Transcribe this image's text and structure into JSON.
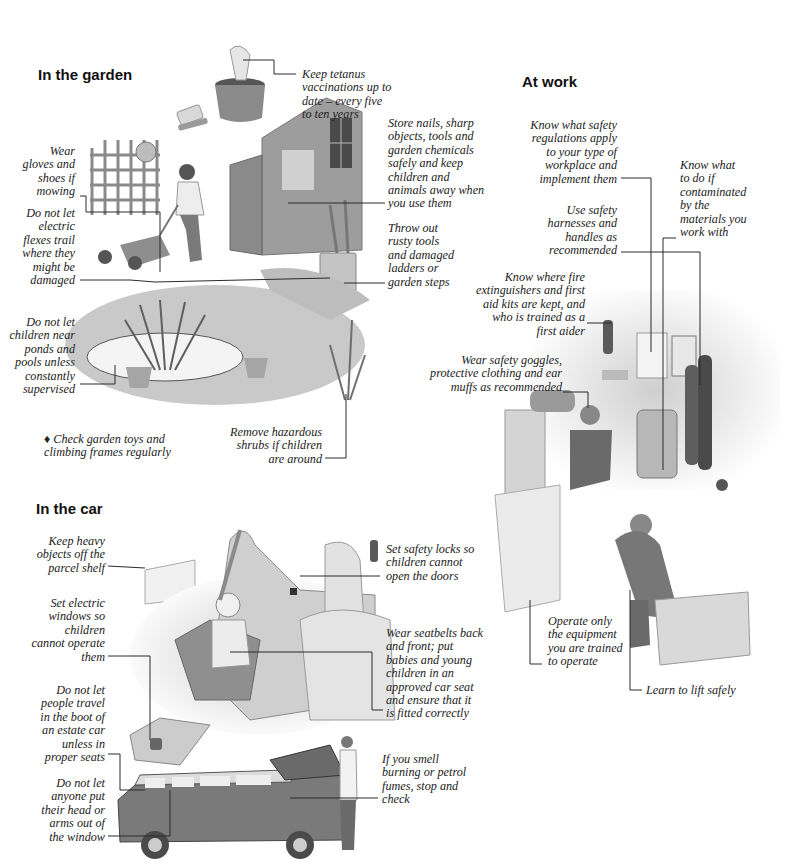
{
  "sections": {
    "garden": {
      "heading": "In the garden",
      "captions": {
        "tetanus": "Keep tetanus\nvaccinations up to\ndate – every five\nto ten years",
        "store": "Store nails, sharp\nobjects, tools and\ngarden chemicals\nsafely and keep\nchildren and\nanimals away when\nyou use them",
        "throw": "Throw out\nrusty tools\nand damaged\nladders or\ngarden steps",
        "gloves": "Wear\ngloves and\nshoes if\nmowing",
        "flexes": "Do not let\nelectric\nflexes trail\nwhere they\nmight be\ndamaged",
        "ponds": "Do not let\nchildren near\nponds and\npools unless\nconstantly\nsupervised",
        "toys": "♦ Check garden toys and\nclimbing frames regularly",
        "shrubs": "Remove hazardous\nshrubs if children\nare around"
      }
    },
    "work": {
      "heading": "At work",
      "captions": {
        "regulations": "Know what safety\nregulations apply\nto your type of\nworkplace and\nimplement them",
        "contaminated": "Know what\nto do if\ncontaminated\nby the\nmaterials you\nwork with",
        "harnesses": "Use safety\nharnesses and\nhandles as\nrecommended",
        "fire": "Know where fire\nextinguishers and first\naid kits are kept, and\nwho is trained as a\nfirst aider",
        "goggles": "Wear safety goggles,\nprotective clothing and ear\nmuffs as recommended",
        "operate": "Operate only\nthe equipment\nyou are trained\nto operate",
        "lift": "Learn to lift safely"
      }
    },
    "car": {
      "heading": "In the car",
      "captions": {
        "parcel": "Keep heavy\nobjects off the\nparcel shelf",
        "windows": "Set electric\nwindows so\nchildren\ncannot operate\nthem",
        "boot": "Do not let\npeople travel\nin the boot of\nan estate car\nunless in\nproper seats",
        "head": "Do not let\nanyone put\ntheir head or\narms out of\nthe window",
        "locks": "Set safety locks so\nchildren cannot\nopen the doors",
        "seatbelts": "Wear seatbelts back\nand front; put\nbabies and young\nchildren in an\napproved car seat\nand ensure that it\nis fitted correctly",
        "fumes": "If you smell\nburning or petrol\nfumes, stop and\ncheck"
      }
    }
  },
  "colors": {
    "ink": "#1a1a1a",
    "line": "#2a2a2a",
    "illus_dark": "#6e6e6e",
    "illus_mid": "#a8a8a8",
    "illus_light": "#d9d9d9"
  }
}
